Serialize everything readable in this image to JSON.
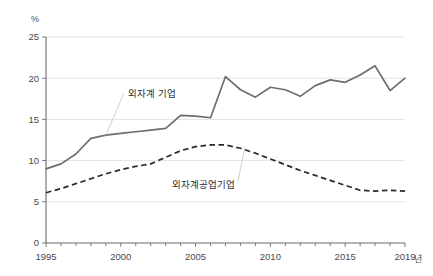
{
  "chart_data": {
    "type": "line",
    "title": "",
    "xlabel": "년",
    "ylabel": "%",
    "ylim": [
      0,
      25
    ],
    "xlim": [
      1995,
      2019
    ],
    "grid": true,
    "legend_position": "inline-annotations",
    "y_ticks": [
      "0",
      "5",
      "10",
      "15",
      "20",
      "25"
    ],
    "y_tick_values": [
      0,
      5,
      10,
      15,
      20,
      25
    ],
    "x_ticks": [
      "1995",
      "2000",
      "2005",
      "2010",
      "2015",
      "2019"
    ],
    "x_tick_values": [
      1995,
      2000,
      2005,
      2010,
      2015,
      2019
    ],
    "x": [
      1995,
      1996,
      1997,
      1998,
      1999,
      2000,
      2001,
      2002,
      2003,
      2004,
      2005,
      2006,
      2007,
      2008,
      2009,
      2010,
      2011,
      2012,
      2013,
      2014,
      2015,
      2016,
      2017,
      2018,
      2019
    ],
    "series": [
      {
        "name": "외자계 기업",
        "style": "solid",
        "color": "#6d6d6d",
        "values": [
          9.0,
          9.6,
          10.8,
          12.7,
          13.1,
          13.3,
          13.5,
          13.7,
          13.9,
          15.5,
          15.4,
          15.2,
          20.2,
          18.6,
          17.7,
          18.9,
          18.6,
          17.8,
          19.1,
          19.8,
          19.5,
          20.4,
          21.5,
          18.5,
          20.0
        ]
      },
      {
        "name": "외자계공업기업",
        "style": "dashed",
        "color": "#2b2b2b",
        "values": [
          6.1,
          6.6,
          7.2,
          7.8,
          8.4,
          8.9,
          9.3,
          9.6,
          10.4,
          11.2,
          11.7,
          11.9,
          11.9,
          11.5,
          10.9,
          10.2,
          9.5,
          8.8,
          8.2,
          7.6,
          7.0,
          6.4,
          6.3,
          6.4,
          6.3
        ]
      }
    ],
    "annotations": [
      {
        "text": "외자계 기업",
        "series": "외자계 기업"
      },
      {
        "text": "외자계공업기업",
        "series": "외자계공업기업"
      }
    ]
  },
  "axes": {
    "y_unit": "%",
    "x_unit": "년"
  }
}
